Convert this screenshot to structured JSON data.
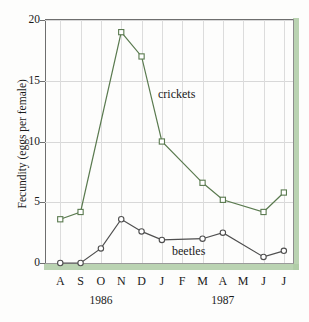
{
  "figure": {
    "ylabel": "Fecundity (eggs per female)",
    "accent_color": "#aecba4",
    "crickets_color": "#5a7a4f",
    "beetles_color": "#4f4f4f"
  },
  "chart_data": {
    "type": "line",
    "title": "",
    "xlabel": "",
    "ylabel": "Fecundity (eggs per female)",
    "categories": [
      "A",
      "S",
      "O",
      "N",
      "D",
      "J",
      "F",
      "M",
      "A",
      "M",
      "J",
      "J"
    ],
    "x_group_labels": [
      {
        "label": "1986",
        "start": "A",
        "end": "D"
      },
      {
        "label": "1987",
        "start": "J",
        "end": "J"
      }
    ],
    "ylim": [
      0,
      20
    ],
    "yticks": [
      0,
      5,
      10,
      15,
      20
    ],
    "ytick_labels": [
      "0",
      "5",
      "10",
      "15",
      "20"
    ],
    "grid": true,
    "legend": "inline-annotations",
    "series": [
      {
        "name": "crickets",
        "marker": "square",
        "color": "#5a7a4f",
        "values": [
          3.6,
          4.2,
          null,
          19.0,
          17.0,
          10.0,
          null,
          6.6,
          5.2,
          null,
          4.2,
          5.8
        ],
        "points": [
          {
            "x": "A",
            "y": 3.6
          },
          {
            "x": "S",
            "y": 4.2
          },
          {
            "x": "N",
            "y": 19.0
          },
          {
            "x": "D",
            "y": 17.0
          },
          {
            "x": "J",
            "y": 10.0
          },
          {
            "x": "M",
            "y": 6.6
          },
          {
            "x": "A",
            "y": 5.2
          },
          {
            "x": "J",
            "y": 4.2
          },
          {
            "x": "J",
            "y": 5.8
          }
        ],
        "annotation": "crickets"
      },
      {
        "name": "beetles",
        "marker": "circle",
        "color": "#4f4f4f",
        "values": [
          0.0,
          0.0,
          1.2,
          3.6,
          2.6,
          1.9,
          null,
          2.0,
          2.5,
          null,
          0.5,
          1.0
        ],
        "points": [
          {
            "x": "A",
            "y": 0.0
          },
          {
            "x": "S",
            "y": 0.0
          },
          {
            "x": "O",
            "y": 1.2
          },
          {
            "x": "N",
            "y": 3.6
          },
          {
            "x": "D",
            "y": 2.6
          },
          {
            "x": "J",
            "y": 1.9
          },
          {
            "x": "M",
            "y": 2.0
          },
          {
            "x": "A",
            "y": 2.5
          },
          {
            "x": "J",
            "y": 0.5
          },
          {
            "x": "J",
            "y": 1.0
          }
        ],
        "annotation": "beetles"
      }
    ],
    "annotations": [
      {
        "text": "crickets",
        "series": "crickets"
      },
      {
        "text": "beetles",
        "series": "beetles"
      }
    ]
  }
}
